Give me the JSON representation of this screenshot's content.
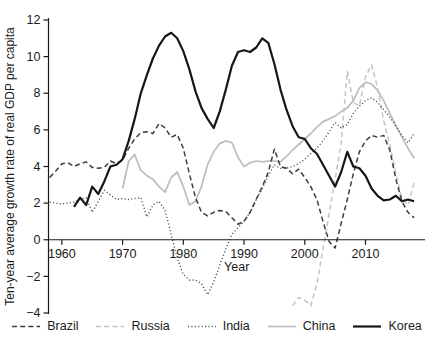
{
  "chart_data": {
    "type": "line",
    "title": "",
    "xlabel": "Year",
    "ylabel": "Ten-year average growth rate of real GDP per capita",
    "xlim": [
      1957.8,
      2019.8
    ],
    "ylim": [
      -4,
      12
    ],
    "xticks": [
      1960,
      1970,
      1980,
      1990,
      2000,
      2010
    ],
    "yticks": [
      12,
      10,
      8,
      6,
      4,
      2,
      0,
      -2,
      -4
    ],
    "ytick_labels": [
      "12",
      "10",
      "8",
      "6",
      "4",
      "2",
      "0",
      "−2",
      "−4"
    ],
    "grid": false,
    "legend_position": "bottom",
    "axis_color": "#1a1a1a",
    "draw_order": [
      1,
      3,
      2,
      0,
      4
    ],
    "series": [
      {
        "name": "Brazil",
        "color": "#3d3d3d",
        "dash": "5 3.2",
        "width": 1.5,
        "x_start": 1958,
        "x_step": 1,
        "y": [
          3.4,
          3.75,
          4.15,
          4.2,
          4.0,
          4.15,
          4.25,
          3.95,
          3.9,
          3.95,
          4.3,
          4.15,
          4.35,
          5.0,
          5.5,
          5.85,
          5.9,
          5.8,
          6.35,
          6.1,
          5.6,
          5.75,
          5.0,
          3.6,
          2.3,
          1.5,
          1.3,
          1.5,
          1.6,
          1.55,
          1.2,
          0.85,
          1.0,
          1.5,
          2.2,
          2.9,
          3.7,
          4.95,
          4.0,
          3.9,
          3.6,
          3.85,
          3.4,
          2.9,
          2.2,
          1.0,
          -0.1,
          -0.45,
          0.9,
          2.2,
          3.6,
          4.8,
          5.4,
          5.7,
          5.6,
          5.7,
          4.9,
          3.3,
          2.1,
          1.5,
          1.2
        ]
      },
      {
        "name": "Russia",
        "color": "#c4c4c4",
        "dash": "5 3.2",
        "width": 1.5,
        "x_start": 1998,
        "x_step": 1,
        "y": [
          -3.6,
          -3.15,
          -3.3,
          -3.6,
          -2.4,
          -0.5,
          1.4,
          3.3,
          5.3,
          9.2,
          7.5,
          7.3,
          8.9,
          9.55,
          8.3,
          6.5,
          5.2,
          3.6,
          2.3,
          1.9,
          3.1
        ]
      },
      {
        "name": "India",
        "color": "#4e4e4e",
        "dash": "1.1 2.3",
        "width": 1.4,
        "x_start": 1958,
        "x_step": 1,
        "y": [
          2.05,
          2.0,
          1.95,
          2.0,
          2.05,
          2.2,
          2.3,
          1.5,
          2.1,
          2.7,
          2.45,
          2.2,
          2.25,
          2.2,
          2.25,
          2.3,
          1.25,
          1.9,
          2.1,
          1.6,
          0.3,
          -1.0,
          -1.9,
          -2.2,
          -2.2,
          -2.4,
          -3.0,
          -2.3,
          -1.4,
          -0.5,
          0.3,
          0.65,
          1.0,
          1.5,
          2.2,
          2.8,
          3.5,
          4.1,
          3.9,
          3.9,
          4.0,
          4.15,
          4.4,
          4.7,
          5.0,
          5.4,
          5.9,
          6.4,
          6.1,
          6.3,
          6.9,
          7.3,
          7.6,
          7.75,
          7.5,
          7.1,
          6.7,
          6.2,
          5.7,
          5.3,
          5.8
        ]
      },
      {
        "name": "China",
        "color": "#bdbdbd",
        "dash": null,
        "width": 1.7,
        "x_start": 1970,
        "x_step": 1,
        "y": [
          2.8,
          4.3,
          4.65,
          3.8,
          3.5,
          3.3,
          2.9,
          2.6,
          3.4,
          3.7,
          2.9,
          1.9,
          2.1,
          2.9,
          4.1,
          4.8,
          5.25,
          5.4,
          5.3,
          4.5,
          4.0,
          4.2,
          4.3,
          4.25,
          4.3,
          4.3,
          4.25,
          4.55,
          4.9,
          5.2,
          5.5,
          5.8,
          6.15,
          6.45,
          6.6,
          6.75,
          7.0,
          7.2,
          7.6,
          8.3,
          8.6,
          8.5,
          8.15,
          7.6,
          6.9,
          6.25,
          5.6,
          5.0,
          4.45
        ]
      },
      {
        "name": "Korea",
        "color": "#161616",
        "dash": null,
        "width": 2.2,
        "x_start": 1962,
        "x_step": 1,
        "y": [
          1.8,
          2.3,
          1.9,
          2.9,
          2.5,
          3.2,
          4.0,
          4.1,
          4.4,
          5.4,
          6.6,
          8.0,
          9.0,
          9.9,
          10.6,
          11.1,
          11.3,
          11.0,
          10.3,
          9.3,
          8.1,
          7.2,
          6.6,
          6.1,
          7.0,
          8.2,
          9.5,
          10.25,
          10.35,
          10.25,
          10.5,
          11.0,
          10.75,
          9.6,
          8.2,
          7.1,
          6.2,
          5.6,
          5.5,
          5.0,
          4.7,
          4.1,
          3.5,
          2.9,
          3.7,
          4.8,
          4.0,
          3.9,
          3.5,
          2.8,
          2.4,
          2.15,
          2.2,
          2.4,
          2.1,
          2.2,
          2.1
        ]
      }
    ]
  }
}
